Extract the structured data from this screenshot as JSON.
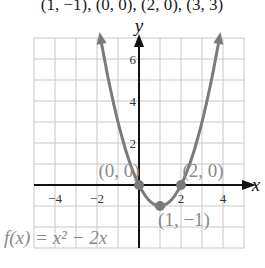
{
  "header_text": "(1, −1), (0, 0), (2, 0), (3, 3)",
  "chart_data": {
    "type": "line",
    "title": "",
    "function": "f(x) = x^2 - 2x",
    "label": "f(x) = x² − 2x",
    "xlabel": "x",
    "ylabel": "y",
    "xlim": [
      -5,
      5
    ],
    "ylim": [
      -3,
      7
    ],
    "grid": true,
    "x_ticks": [
      -4,
      -2,
      2,
      4
    ],
    "y_ticks": [
      2,
      4,
      6
    ],
    "x_tick_labels": [
      "−4",
      "−2",
      "2",
      "4"
    ],
    "y_tick_labels": [
      "2",
      "4",
      "6"
    ],
    "series": [
      {
        "name": "f(x) = x² − 2x",
        "x": [
          -1.646,
          -1,
          0,
          1,
          2,
          3,
          3.646
        ],
        "y": [
          6,
          3,
          0,
          -1,
          0,
          3,
          6
        ]
      }
    ],
    "points": [
      {
        "x": 0,
        "y": 0,
        "label": "(0, 0)"
      },
      {
        "x": 2,
        "y": 0,
        "label": "(2, 0)"
      },
      {
        "x": 1,
        "y": -1,
        "label": "(1, −1)"
      }
    ],
    "colors": {
      "curve": "#7a7a7a",
      "grid": "#c8c8c8",
      "axis": "#111111",
      "label": "#8a8a8a"
    }
  }
}
